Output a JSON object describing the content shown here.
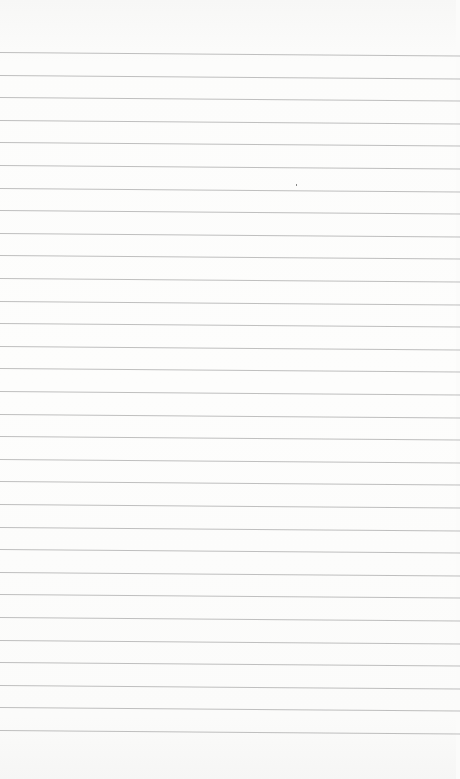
{
  "paper": {
    "type": "lined-notebook-paper",
    "background_color": "#fbfbfa",
    "rule_color": "#a9a9a9",
    "rule_count": 31,
    "first_rule_y": 52,
    "rule_spacing": 22.6,
    "text": ""
  }
}
